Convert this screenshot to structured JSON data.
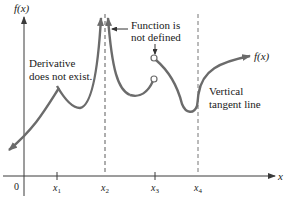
{
  "diagram": {
    "y_axis_label": "f(x)",
    "x_axis_label": "x",
    "origin_label": "0",
    "curve_label": "f(x)",
    "ticks": [
      {
        "name": "x",
        "sub": "1"
      },
      {
        "name": "x",
        "sub": "2"
      },
      {
        "name": "x",
        "sub": "3"
      },
      {
        "name": "x",
        "sub": "4"
      }
    ],
    "annotations": {
      "derivative_line1": "Derivative",
      "derivative_line2": "does not exist.",
      "undefined_line1": "Function is",
      "undefined_line2": "not defined",
      "vertical_line1": "Vertical",
      "vertical_line2": "tangent line"
    },
    "colors": {
      "curve": "#6b6b6b",
      "axis": "#3a3a3a",
      "dashed": "#777777",
      "text": "#1a1a1a"
    }
  }
}
